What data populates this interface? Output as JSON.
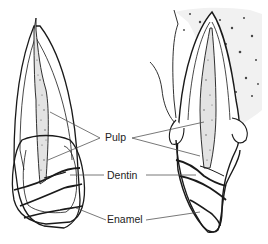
{
  "figure": {
    "labels": {
      "pulp": "Pulp",
      "dentin": "Dentin",
      "enamel": "Enamel"
    },
    "colors": {
      "line": "#1a1a1a",
      "leader": "#555555",
      "background": "#ffffff",
      "pulp_fill": "#e6e6e6",
      "bone_fill": "#f3f3f3"
    }
  }
}
